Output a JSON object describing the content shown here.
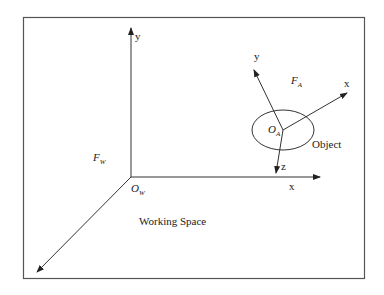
{
  "diagram": {
    "world_frame": {
      "frame_label": "F",
      "frame_sub": "W",
      "origin_label": "O",
      "origin_sub": "W",
      "axes": {
        "x": "x",
        "y": "y"
      }
    },
    "object_frame": {
      "frame_label": "F",
      "frame_sub": "A",
      "origin_label": "O",
      "origin_sub": "A",
      "axes": {
        "x": "x",
        "y": "y",
        "z": "z"
      }
    },
    "object_label": "Object",
    "space_label": "Working Space"
  }
}
